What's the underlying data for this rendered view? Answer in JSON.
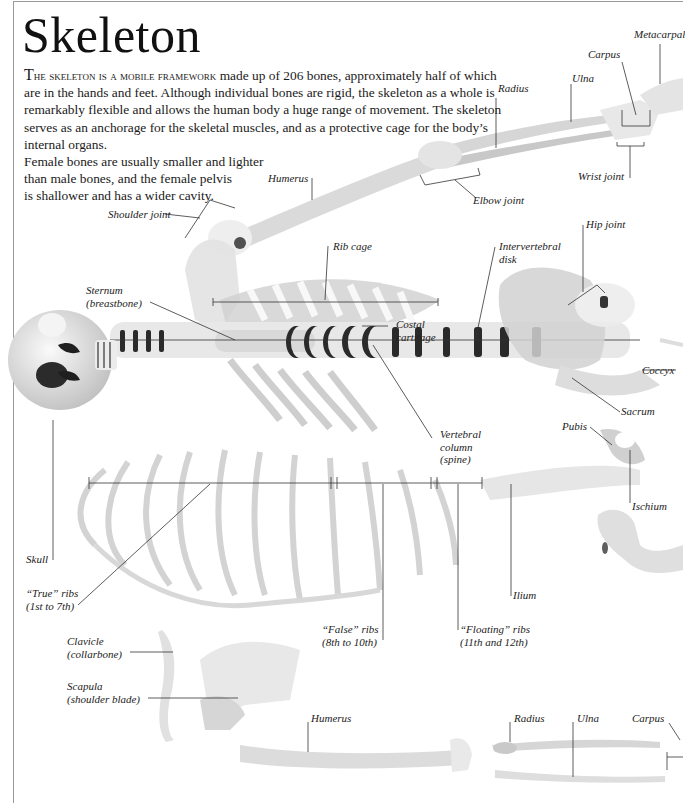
{
  "page": {
    "title": "Skeleton",
    "intro": {
      "lead_first_letter": "T",
      "lead_small_caps": "he skeleton is a mobile framework",
      "body": " made up of 206 bones, approximately half of which are in the hands and feet. Although individual bones are rigid, the skeleton as a whole is remarkably flexible and allows the human body a huge range of movement. The skeleton serves as an anchorage for the skeletal muscles, and as a protective cage for the body’s internal organs.",
      "female_note_lines": [
        "Female bones are usually smaller and lighter",
        "than male bones, and the female pelvis",
        "is shallower and has a wider cavity."
      ]
    }
  },
  "labels": {
    "metacarpal": "Metacarpal",
    "carpus_top": "Carpus",
    "ulna_top": "Ulna",
    "radius_top": "Radius",
    "wrist_joint": "Wrist joint",
    "elbow_joint": "Elbow joint",
    "humerus_top": "Humerus",
    "shoulder_joint": "Shoulder joint",
    "rib_cage": "Rib cage",
    "intervertebral_disk": [
      "Intervertebral",
      "disk"
    ],
    "hip_joint": "Hip joint",
    "sternum": [
      "Sternum",
      "(breastbone)"
    ],
    "costal_cartilage": [
      "Costal",
      "cartilage"
    ],
    "coccyx": "Coccyx",
    "sacrum": "Sacrum",
    "vertebral_column": [
      "Vertebral",
      "column",
      "(spine)"
    ],
    "pubis": "Pubis",
    "ischium": "Ischium",
    "skull": "Skull",
    "true_ribs": [
      "“True” ribs",
      "(1st to 7th)"
    ],
    "false_ribs": [
      "“False” ribs",
      "(8th to 10th)"
    ],
    "floating_ribs": [
      "“Floating” ribs",
      "(11th and 12th)"
    ],
    "ilium": "Ilium",
    "clavicle": [
      "Clavicle",
      "(collarbone)"
    ],
    "scapula": [
      "Scapula",
      "(shoulder blade)"
    ],
    "humerus_bottom": "Humerus",
    "radius_bottom": "Radius",
    "ulna_bottom": "Ulna",
    "carpus_bottom": "Carpus"
  },
  "colors": {
    "text": "#1a1a1a",
    "border": "#9a9a9a",
    "bone_light": "#e6e6e6",
    "bone_mid": "#c4c4c4",
    "bone_dark": "#8c8c8c",
    "disk_dark": "#2a2a2a",
    "leader_line": "#333333"
  }
}
